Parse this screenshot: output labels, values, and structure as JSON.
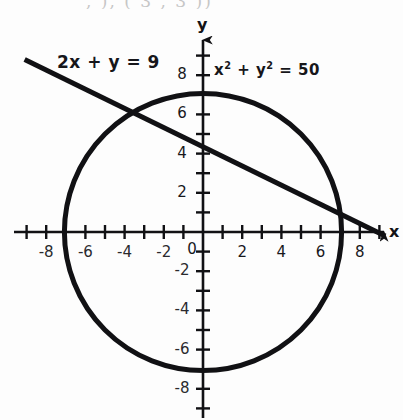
{
  "figure": {
    "title_fragment": ", ), (  3 , 3 ))",
    "background_color": "#fdfdfd",
    "ink_color": "#111114",
    "axes": {
      "x_axis_name": "x",
      "y_axis_name": "y",
      "origin_label": "0",
      "x_tick_labels": [
        "-8",
        "-6",
        "-4",
        "-2",
        "2",
        "4",
        "6",
        "8"
      ],
      "x_tick_values": [
        -8,
        -6,
        -4,
        -2,
        2,
        4,
        6,
        8
      ],
      "y_tick_labels": [
        "8",
        "6",
        "4",
        "2",
        "-2",
        "-4",
        "-6",
        "-8"
      ],
      "y_tick_values": [
        8,
        6,
        4,
        2,
        -2,
        -4,
        -6,
        -8
      ],
      "minor_tick_values": [
        -9,
        -8,
        -7,
        -6,
        -5,
        -4,
        -3,
        -2,
        -1,
        1,
        2,
        3,
        4,
        5,
        6,
        7,
        8,
        9
      ]
    },
    "labels": {
      "line_equation": "2x + y = 9",
      "circle_equation_base": "x",
      "circle_equation_full": "x² + y² = 50"
    }
  },
  "chart_data": {
    "type": "line",
    "title": "",
    "xlabel": "x",
    "ylabel": "y",
    "xlim": [
      -9.8,
      9.8
    ],
    "ylim": [
      -9.6,
      9.6
    ],
    "grid": false,
    "legend": "none",
    "aspect": "equal",
    "series": [
      {
        "name": "x² + y² = 50",
        "kind": "circle",
        "center": [
          0,
          0
        ],
        "radius": 7.071,
        "radius_squared": 50,
        "label_text": "x² + y² = 50",
        "label_position": [
          0.6,
          8.1
        ],
        "stroke_width_px": 5
      },
      {
        "name": "2x + y = 9",
        "kind": "straight-line",
        "slope": -2,
        "y_intercept": 9,
        "drawn_slope": -0.5,
        "drawn_y_intercept": 4.5,
        "x_intercept": 9,
        "endpoints": [
          [
            -9.1,
            8.8
          ],
          [
            9.3,
            -0.2
          ]
        ],
        "label_text": "2x + y = 9",
        "label_position": [
          -7.2,
          8.6
        ],
        "stroke_width_px": 5
      }
    ],
    "annotations": [
      {
        "text": "2x + y = 9",
        "x": -7.2,
        "y": 8.6
      },
      {
        "text": "x² + y² = 50",
        "x": 0.6,
        "y": 8.1
      },
      {
        "text": "y",
        "x": 0,
        "y": 9.6
      },
      {
        "text": "x",
        "x": 9.6,
        "y": 0
      }
    ]
  }
}
